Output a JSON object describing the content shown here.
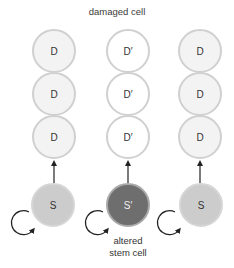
{
  "title": "damaged cell",
  "columns": [
    {
      "id": "normal-left",
      "differentiated": [
        "D",
        "D",
        "D"
      ],
      "stem": "S",
      "differentiated_fill": "#f3f3f3",
      "stem_fill": "#cccccc"
    },
    {
      "id": "altered-middle",
      "differentiated": [
        "D′",
        "D′",
        "D′"
      ],
      "stem": "S′",
      "differentiated_fill": "#ffffff",
      "stem_fill": "#6e6e6e",
      "caption_lines": [
        "altered",
        "stem cell"
      ]
    },
    {
      "id": "normal-right",
      "differentiated": [
        "D",
        "D",
        "D"
      ],
      "stem": "S",
      "differentiated_fill": "#f3f3f3",
      "stem_fill": "#cccccc"
    }
  ],
  "colors": {
    "cell_border": "#d0d0d0",
    "arrow": "#222222",
    "altered_stem_border": "#a9a9a9"
  }
}
